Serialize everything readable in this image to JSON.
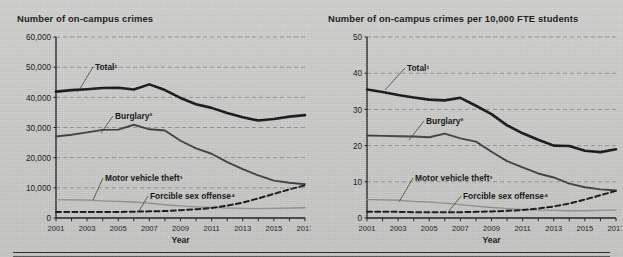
{
  "figure": {
    "background_color": "#c8c8c6",
    "axis_color": "#1a1a1a",
    "gridline_color": "#8d8d8d"
  },
  "panels": [
    {
      "id": "counts",
      "title": "Number of on-campus crimes",
      "xlabel": "Year",
      "series_labels": {
        "total": "Total¹",
        "burglary": "Burglary²",
        "motor_vehicle_theft": "Motor vehicle theft³",
        "forcible_sex_offense": "Forcible sex offense⁴"
      }
    },
    {
      "id": "rate",
      "title": "Number of on-campus crimes per 10,000 FTE students",
      "xlabel": "Year",
      "series_labels": {
        "total": "Total¹",
        "burglary": "Burglary²",
        "motor_vehicle_theft": "Motor vehicle theft³",
        "forcible_sex_offense": "Forcible sex offense⁴"
      }
    }
  ],
  "chart_data": [
    {
      "type": "line",
      "title": "Number of on-campus crimes",
      "xlabel": "Year",
      "ylabel": "",
      "x": [
        2001,
        2002,
        2003,
        2004,
        2005,
        2006,
        2007,
        2008,
        2009,
        2010,
        2011,
        2012,
        2013,
        2014,
        2015,
        2016,
        2017
      ],
      "xticklabels": [
        "2001",
        "",
        "2003",
        "",
        "2005",
        "",
        "2007",
        "",
        "2009",
        "",
        "2011",
        "",
        "2013",
        "",
        "2015",
        "",
        "2017"
      ],
      "xlim": [
        2001,
        2017
      ],
      "ylim": [
        0,
        60000
      ],
      "yticks": [
        0,
        10000,
        20000,
        30000,
        40000,
        50000,
        60000
      ],
      "yticklabels": [
        "0",
        "10,000",
        "20,000",
        "30,000",
        "40,000",
        "50,000",
        "60,000"
      ],
      "grid": true,
      "legend": "inline-annotations",
      "series": [
        {
          "name": "Total¹",
          "style": "solid-thick",
          "color": "#141414",
          "values": [
            41900,
            42400,
            42700,
            43100,
            43200,
            42600,
            44300,
            42400,
            39800,
            37700,
            36500,
            34800,
            33400,
            32300,
            32800,
            33600,
            34100
          ]
        },
        {
          "name": "Burglary²",
          "style": "solid-medium",
          "color": "#3d3d3d",
          "values": [
            27000,
            27600,
            28400,
            29200,
            29300,
            30900,
            29400,
            29000,
            25600,
            23100,
            21300,
            18500,
            16200,
            14100,
            12400,
            11700,
            11200
          ]
        },
        {
          "name": "Motor vehicle theft³",
          "style": "solid-thin-light",
          "color": "#8a8a8a",
          "values": [
            6000,
            6000,
            5900,
            5700,
            5500,
            5300,
            4900,
            4400,
            4000,
            3700,
            3500,
            3300,
            3200,
            3100,
            3200,
            3300,
            3400
          ]
        },
        {
          "name": "Forcible sex offense⁴",
          "style": "dashed",
          "color": "#141414",
          "values": [
            2000,
            2000,
            2000,
            2000,
            2000,
            2100,
            2200,
            2300,
            2600,
            2900,
            3300,
            4100,
            5100,
            6500,
            8000,
            9500,
            10800
          ]
        }
      ]
    },
    {
      "type": "line",
      "title": "Number of on-campus crimes per 10,000 FTE students",
      "xlabel": "Year",
      "ylabel": "",
      "x": [
        2001,
        2002,
        2003,
        2004,
        2005,
        2006,
        2007,
        2008,
        2009,
        2010,
        2011,
        2012,
        2013,
        2014,
        2015,
        2016,
        2017
      ],
      "xticklabels": [
        "2001",
        "",
        "2003",
        "",
        "2005",
        "",
        "2007",
        "",
        "2009",
        "",
        "2011",
        "",
        "2013",
        "",
        "2015",
        "",
        "2017"
      ],
      "xlim": [
        2001,
        2017
      ],
      "ylim": [
        0,
        50
      ],
      "yticks": [
        0,
        10,
        20,
        30,
        40,
        50
      ],
      "yticklabels": [
        "0",
        "10",
        "20",
        "30",
        "40",
        "50"
      ],
      "grid": true,
      "legend": "inline-annotations",
      "series": [
        {
          "name": "Total¹",
          "style": "solid-thick",
          "color": "#141414",
          "values": [
            35.5,
            34.8,
            34.0,
            33.3,
            32.7,
            32.5,
            33.2,
            31.0,
            28.7,
            25.6,
            23.4,
            21.6,
            20.0,
            19.9,
            18.6,
            18.2,
            19.0,
            19.5
          ]
        },
        {
          "name": "Burglary²",
          "style": "solid-medium",
          "color": "#3d3d3d",
          "values": [
            22.8,
            22.7,
            22.6,
            22.5,
            22.3,
            23.3,
            22.0,
            21.1,
            18.3,
            15.7,
            14.0,
            12.3,
            11.2,
            9.5,
            8.5,
            7.9,
            7.6
          ]
        },
        {
          "name": "Motor vehicle theft³",
          "style": "solid-thin-light",
          "color": "#8a8a8a",
          "values": [
            5.1,
            5.0,
            4.9,
            4.6,
            4.4,
            4.1,
            3.7,
            3.3,
            2.9,
            2.6,
            2.4,
            2.2,
            2.1,
            2.0,
            2.0,
            2.1,
            2.2
          ]
        },
        {
          "name": "Forcible sex offense⁴",
          "style": "dashed",
          "color": "#141414",
          "values": [
            1.7,
            1.7,
            1.7,
            1.6,
            1.6,
            1.6,
            1.6,
            1.7,
            1.8,
            2.0,
            2.2,
            2.6,
            3.2,
            4.0,
            5.1,
            6.3,
            7.5
          ]
        }
      ]
    }
  ]
}
